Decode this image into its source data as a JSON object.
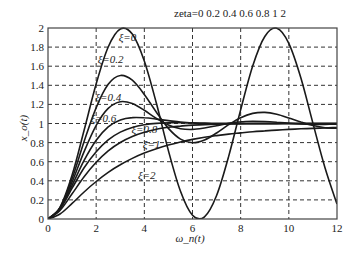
{
  "chart_data": {
    "type": "line",
    "title": "zeta=0 0.2 0.4 0.6 0.8 1 2",
    "xlabel": "ω_n(t)",
    "ylabel": "x_o(t)",
    "xlim": [
      0,
      12
    ],
    "ylim": [
      0,
      2
    ],
    "xticks": [
      0,
      2,
      4,
      6,
      8,
      10,
      12
    ],
    "yticks": [
      0,
      0.2,
      0.4,
      0.6,
      0.8,
      1,
      1.2,
      1.4,
      1.6,
      1.8,
      2
    ],
    "xtick_labels": [
      "0",
      "2",
      "4",
      "6",
      "8",
      "10",
      "12"
    ],
    "ytick_labels": [
      "0",
      "0.2",
      "0.4",
      "0.6",
      "0.8",
      "1",
      "1.2",
      "1.4",
      "1.6",
      "1.8",
      "2"
    ],
    "grid": true,
    "grid_style": "dashed",
    "legend_position": "inline annotations",
    "x": [
      0,
      0.5,
      1,
      1.5,
      2,
      2.5,
      3,
      3.5,
      4,
      4.5,
      5,
      5.5,
      6,
      6.5,
      7,
      7.5,
      8,
      8.5,
      9,
      9.5,
      10,
      10.5,
      11,
      11.5,
      12
    ],
    "series": [
      {
        "name": "ξ=0",
        "zeta": 0,
        "label_pos": [
          3.3,
          1.86
        ],
        "values": [
          0,
          0.122,
          0.46,
          0.929,
          1.416,
          1.801,
          1.99,
          1.936,
          1.654,
          1.211,
          0.716,
          0.291,
          0.04,
          0.023,
          0.246,
          0.653,
          1.146,
          1.602,
          1.911,
          1.997,
          1.839,
          1.476,
          1.004,
          0.537,
          0.156
        ]
      },
      {
        "name": "ξ=0.2",
        "zeta": 0.2,
        "label_pos": [
          2.6,
          1.63
        ],
        "values": [
          0,
          0.118,
          0.423,
          0.811,
          1.167,
          1.41,
          1.503,
          1.453,
          1.305,
          1.118,
          0.949,
          0.837,
          0.799,
          0.828,
          0.901,
          0.987,
          1.061,
          1.106,
          1.116,
          1.096,
          1.058,
          1.015,
          0.979,
          0.956,
          0.95
        ]
      },
      {
        "name": "ξ=0.4",
        "zeta": 0.4,
        "label_pos": [
          2.5,
          1.24
        ],
        "values": [
          0,
          0.114,
          0.387,
          0.706,
          0.981,
          1.158,
          1.228,
          1.209,
          1.138,
          1.053,
          0.984,
          0.946,
          0.938,
          0.953,
          0.977,
          1.002,
          1.018,
          1.024,
          1.021,
          1.013,
          1.003,
          0.995,
          0.991,
          0.991,
          0.993
        ]
      },
      {
        "name": "ξ=0.6",
        "zeta": 0.6,
        "label_pos": [
          2.3,
          1.02
        ],
        "values": [
          0,
          0.11,
          0.353,
          0.614,
          0.825,
          0.964,
          1.037,
          1.062,
          1.06,
          1.046,
          1.03,
          1.015,
          1.005,
          1.0,
          0.998,
          0.998,
          0.999,
          1.0,
          1.0,
          1.0,
          1.0,
          1.0,
          1.0,
          1.0,
          1.0
        ]
      },
      {
        "name": "ξ=0.8",
        "zeta": 0.8,
        "label_pos": [
          4.0,
          0.9
        ],
        "values": [
          0,
          0.106,
          0.322,
          0.536,
          0.705,
          0.829,
          0.91,
          0.959,
          0.987,
          1.001,
          1.007,
          1.008,
          1.007,
          1.005,
          1.003,
          1.002,
          1.001,
          1.0,
          1.0,
          1.0,
          1.0,
          1.0,
          1.0,
          1.0,
          1.0
        ]
      },
      {
        "name": "ξ=1",
        "zeta": 1,
        "label_pos": [
          4.3,
          0.74
        ],
        "values": [
          0,
          0.09,
          0.264,
          0.442,
          0.594,
          0.713,
          0.801,
          0.864,
          0.908,
          0.939,
          0.96,
          0.973,
          0.983,
          0.989,
          0.993,
          0.995,
          0.997,
          0.998,
          0.999,
          0.999,
          1.0,
          1.0,
          1.0,
          1.0,
          1.0
        ]
      },
      {
        "name": "ξ=2",
        "zeta": 2,
        "label_pos": [
          4.1,
          0.42
        ],
        "values": [
          0,
          0.052,
          0.163,
          0.283,
          0.393,
          0.488,
          0.568,
          0.635,
          0.69,
          0.736,
          0.774,
          0.806,
          0.833,
          0.855,
          0.873,
          0.889,
          0.902,
          0.914,
          0.923,
          0.931,
          0.938,
          0.944,
          0.949,
          0.954,
          0.958
        ]
      }
    ]
  },
  "layout": {
    "plot": {
      "left": 48,
      "top": 28,
      "right": 337,
      "bottom": 219
    },
    "line_color": "#1a1a1a",
    "grid_color": "#333333",
    "frame_color": "#444444"
  }
}
